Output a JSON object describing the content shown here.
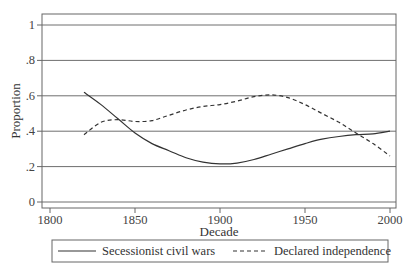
{
  "chart_data": {
    "type": "line",
    "title": "",
    "xlabel": "Decade",
    "ylabel": "Proportion",
    "xlim": [
      1800,
      2000
    ],
    "ylim": [
      0,
      1
    ],
    "x_ticks": [
      1800,
      1850,
      1900,
      1950,
      2000
    ],
    "x_tick_labels": [
      "1800",
      "1850",
      "1900",
      "1950",
      "2000"
    ],
    "y_ticks": [
      0,
      0.2,
      0.4,
      0.6,
      0.8,
      1
    ],
    "y_tick_labels": [
      "0",
      ".2",
      ".4",
      ".6",
      ".8",
      "1"
    ],
    "grid": "horizontal",
    "legend_position": "bottom",
    "x": [
      1820,
      1830,
      1840,
      1850,
      1860,
      1870,
      1880,
      1890,
      1900,
      1910,
      1920,
      1930,
      1940,
      1950,
      1960,
      1970,
      1980,
      1990,
      2000
    ],
    "series": [
      {
        "name": "Secessionist civil wars",
        "style": "solid",
        "color": "#333333",
        "values": [
          0.62,
          0.55,
          0.47,
          0.39,
          0.33,
          0.29,
          0.25,
          0.225,
          0.215,
          0.22,
          0.24,
          0.27,
          0.3,
          0.33,
          0.355,
          0.37,
          0.38,
          0.385,
          0.4
        ]
      },
      {
        "name": "Declared independence",
        "style": "dashed",
        "color": "#333333",
        "values": [
          0.38,
          0.45,
          0.465,
          0.455,
          0.46,
          0.49,
          0.52,
          0.54,
          0.55,
          0.57,
          0.595,
          0.605,
          0.59,
          0.55,
          0.5,
          0.45,
          0.39,
          0.33,
          0.26
        ]
      }
    ]
  },
  "legend": {
    "items": [
      {
        "label": "Secessionist civil wars",
        "style": "solid"
      },
      {
        "label": "Declared independence",
        "style": "dashed"
      }
    ]
  }
}
